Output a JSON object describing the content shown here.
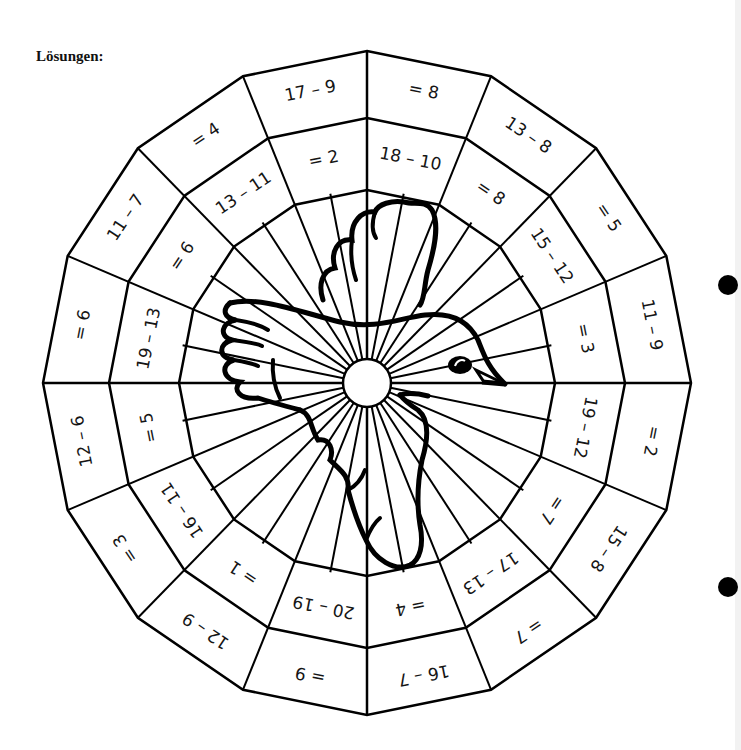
{
  "heading": "Lösungen:",
  "colors": {
    "ink": "#151515",
    "paper": "#ffffff",
    "edge": "#f2f2f2"
  },
  "wheel": {
    "center": [
      367,
      383
    ],
    "sectors": 16,
    "rings": {
      "outer": [
        324,
        332
      ],
      "middle": [
        258,
        265
      ],
      "inner": [
        188,
        193
      ],
      "hub": 24
    },
    "cells": [
      {
        "sector": 0,
        "outer": "= 8",
        "middle": "18 – 10"
      },
      {
        "sector": 1,
        "outer": "13 – 8",
        "middle": "= 8"
      },
      {
        "sector": 2,
        "outer": "= 5",
        "middle": "15 – 12"
      },
      {
        "sector": 3,
        "outer": "11 – 9",
        "middle": "= 3"
      },
      {
        "sector": 4,
        "outer": "= 2",
        "middle": "19 – 12"
      },
      {
        "sector": 5,
        "outer": "15 – 8",
        "middle": "= 7"
      },
      {
        "sector": 6,
        "outer": "= 7",
        "middle": "17 – 13"
      },
      {
        "sector": 7,
        "outer": "16 – 7",
        "middle": "= 4"
      },
      {
        "sector": 8,
        "outer": "= 9",
        "middle": "20 – 19"
      },
      {
        "sector": 9,
        "outer": "12 – 9",
        "middle": "= 1"
      },
      {
        "sector": 10,
        "outer": "= 3",
        "middle": "16 – 11"
      },
      {
        "sector": 11,
        "outer": "12 – 6",
        "middle": "= 5"
      },
      {
        "sector": 12,
        "outer": "= 6",
        "middle": "19 – 13"
      },
      {
        "sector": 13,
        "outer": "11 – 7",
        "middle": "= 6"
      },
      {
        "sector": 14,
        "outer": "= 4",
        "middle": "13 – 11"
      },
      {
        "sector": 15,
        "outer": "17 – 9",
        "middle": "= 2"
      }
    ]
  },
  "illustration": {
    "subject": "bird-icon",
    "description": "flying dove outline drawn over wheel center"
  },
  "punch_holes": [
    [
      728,
      285
    ],
    [
      728,
      587
    ]
  ]
}
